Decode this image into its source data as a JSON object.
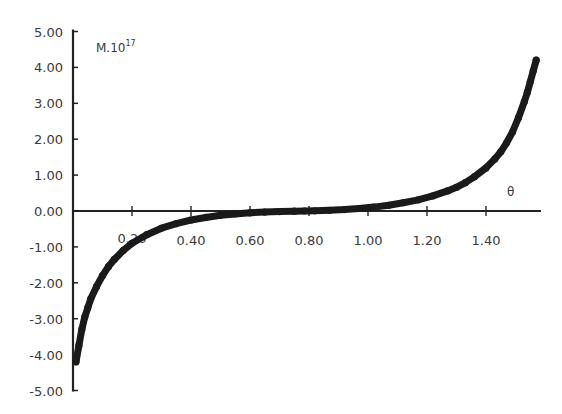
{
  "chart_data": {
    "type": "scatter",
    "title": "",
    "xlabel": "θ",
    "ylabel": "M.10¹⁷",
    "ylabel_base": "M.10",
    "ylabel_exp": "17",
    "xlim": [
      0,
      1.58
    ],
    "ylim": [
      -5,
      5
    ],
    "grid": false,
    "legend": null,
    "x_ticks": [
      0.2,
      0.4,
      0.6,
      0.8,
      1.0,
      1.2,
      1.4
    ],
    "x_tick_labels": [
      "0.20",
      "0.40",
      "0.60",
      "0.80",
      "1.00",
      "1.20",
      "1.40"
    ],
    "y_ticks": [
      5,
      4,
      3,
      2,
      1,
      0,
      -1,
      -2,
      -3,
      -4,
      -5
    ],
    "y_tick_labels": [
      "5.00",
      "4.00",
      "3.00",
      "2.00",
      "1.00",
      "0.00",
      "-1.00",
      "-2.00",
      "-3.00",
      "-4.00",
      "-5.00"
    ],
    "series": [
      {
        "name": "M",
        "color": "#1a1a1a",
        "x": [
          0.01,
          0.02,
          0.03,
          0.04,
          0.05,
          0.06,
          0.08,
          0.1,
          0.12,
          0.14,
          0.17,
          0.2,
          0.25,
          0.3,
          0.35,
          0.4,
          0.45,
          0.5,
          0.55,
          0.6,
          0.65,
          0.7,
          0.75,
          0.785,
          0.82,
          0.87,
          0.92,
          0.97,
          1.02,
          1.07,
          1.12,
          1.17,
          1.22,
          1.27,
          1.3,
          1.33,
          1.36,
          1.4,
          1.43,
          1.45,
          1.47,
          1.49,
          1.51,
          1.53,
          1.54,
          1.55,
          1.56,
          1.57
        ],
        "y": [
          -4.2,
          -3.75,
          -3.3,
          -2.95,
          -2.7,
          -2.45,
          -2.1,
          -1.8,
          -1.55,
          -1.35,
          -1.1,
          -0.9,
          -0.66,
          -0.48,
          -0.35,
          -0.25,
          -0.18,
          -0.12,
          -0.08,
          -0.05,
          -0.03,
          -0.015,
          -0.005,
          0.0,
          0.005,
          0.02,
          0.04,
          0.07,
          0.11,
          0.16,
          0.23,
          0.31,
          0.42,
          0.56,
          0.66,
          0.79,
          0.95,
          1.2,
          1.45,
          1.65,
          1.9,
          2.2,
          2.6,
          3.05,
          3.3,
          3.6,
          3.9,
          4.2
        ]
      }
    ]
  }
}
